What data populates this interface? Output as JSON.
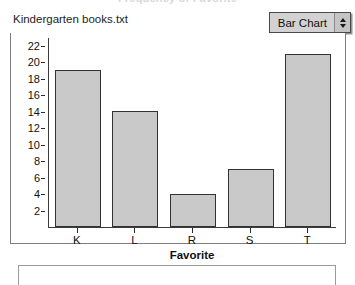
{
  "window": {
    "clipped_title": "Frequency of Favorite"
  },
  "header": {
    "dataset_name": "Kindergarten books.txt",
    "chart_type_selected": "Bar Chart",
    "chart_type_icon": "up-down-arrows-icon"
  },
  "chart_data": {
    "type": "bar",
    "title": "",
    "categories": [
      "K",
      "L",
      "R",
      "S",
      "T"
    ],
    "values": [
      19,
      14,
      4,
      7,
      21
    ],
    "xlabel": "Favorite",
    "ylabel": "",
    "ylim": [
      0,
      23
    ],
    "yticks": [
      2,
      4,
      6,
      8,
      10,
      12,
      14,
      16,
      18,
      20,
      22
    ],
    "ytick_labels": [
      "2",
      "4",
      "6",
      "8",
      "10",
      "12",
      "14",
      "16",
      "18",
      "20",
      "22"
    ],
    "grid": false,
    "legend": null,
    "bar_fill_color": "#c9c9c9",
    "bar_border_color": "#333333"
  },
  "colors": {
    "panel_border": "#7e7e7e",
    "axis": "#3b3b3b",
    "popup_face": "#d2d2d2"
  }
}
